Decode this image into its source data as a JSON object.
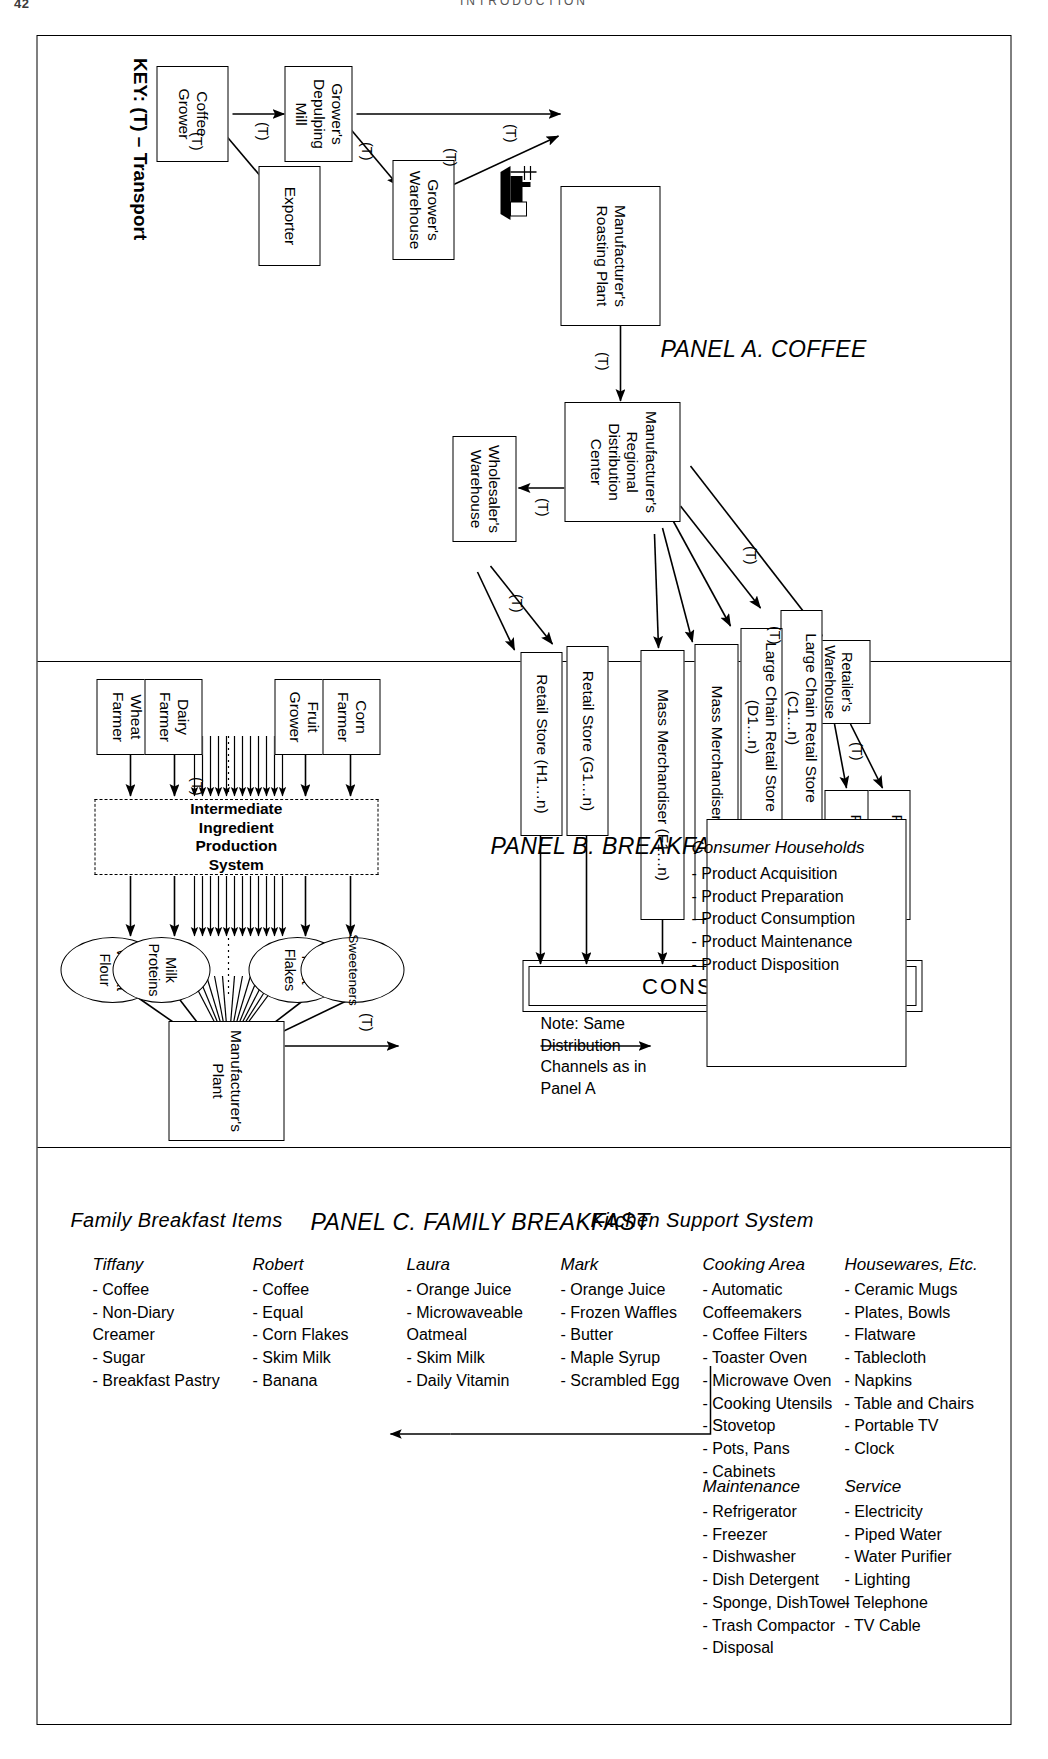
{
  "page": {
    "number": "42",
    "running_head": "INTRODUCTION"
  },
  "figure": {
    "key": "KEY: (T) – Transport",
    "transport_label": "(T)",
    "consumers_label": "CONSUMERS"
  },
  "panel_a": {
    "title": "PANEL A. COFFEE",
    "nodes": {
      "coffee_grower": "Coffee\nGrower",
      "exporter": "Exporter",
      "depulping_mill": "Grower's\nDepulping Mill",
      "growers_warehouse": "Grower's\nWarehouse",
      "roasting_plant": "Manufacturer's\nRoasting Plant",
      "regional_dc": "Manufacturer's\nRegional\nDistribution Center",
      "wholesalers_warehouse": "Wholesaler's\nWarehouse",
      "retailers_warehouse": "Retailer's\nWarehouse",
      "retail_store_a": "Retail Store (A1…n)",
      "retail_store_b": "Retail Store (B1…n)",
      "large_chain_c": "Large Chain\nRetail Store (C1…n)",
      "large_chain_d": "Large Chain\nRetail Store (D1…n)",
      "mass_merch_e": "Mass\nMerchandiser (E1…n)",
      "mass_merch_f": "Mass\nMerchandiser (F1…n)",
      "retail_store_g": "Retail Store (G1…n)",
      "retail_store_h": "Retail Store (H1…n)"
    }
  },
  "panel_b": {
    "title": "PANEL B. BREAKFAST PASTRY",
    "farmers": {
      "wheat_farmer": "Wheat\nFarmer",
      "dairy_farmer": "Dairy\nFarmer",
      "fruit_grower": "Fruit\nGrower",
      "corn_farmer": "Corn\nFarmer"
    },
    "intermediate_system": "Intermediate Ingredient Production\nSystem",
    "ingredients": {
      "wheat_flour": "Wheat\nFlour",
      "milk_proteins": "Milk\nProteins",
      "fruit_flakes": "Fruit\nFlakes",
      "sweeteners": "Sweeteners"
    },
    "manufacturers_plant": "Manufacturer's\nPlant",
    "note": "Note: Same\nDistribution\nChannels as in\nPanel A",
    "consumer_households": {
      "heading": "Consumer Households",
      "items": [
        "-  Product Acquisition",
        "-  Product Preparation",
        "-  Product Consumption",
        "-  Product Maintenance",
        "-  Product Disposition"
      ]
    }
  },
  "panel_c": {
    "title": "PANEL C. FAMILY BREAKFAST",
    "section_items": "Family Breakfast Items",
    "section_kitchen": "Kitchen Support System",
    "columns": [
      {
        "heading": "Tiffany",
        "items": [
          "-  Coffee",
          "-  Non-Diary\n   Creamer",
          "-  Sugar",
          "-  Breakfast Pastry"
        ]
      },
      {
        "heading": "Robert",
        "items": [
          "-  Coffee",
          "-  Equal",
          "-  Corn Flakes",
          "-  Skim Milk",
          "-  Banana"
        ]
      },
      {
        "heading": "Laura",
        "items": [
          "-  Orange Juice",
          "-  Microwaveable\n   Oatmeal",
          "-  Skim Milk",
          "-  Daily Vitamin"
        ]
      },
      {
        "heading": "Mark",
        "items": [
          "-  Orange Juice",
          "-  Frozen Waffles",
          "-  Butter",
          "-  Maple Syrup",
          "-  Scrambled Egg"
        ]
      },
      {
        "heading": "Cooking Area",
        "items": [
          "-  Automatic\n   Coffeemakers",
          "-  Coffee Filters",
          "-  Toaster Oven",
          "-  Microwave Oven",
          "-  Cooking Utensils",
          "-  Stovetop",
          "-  Pots, Pans",
          "-  Cabinets"
        ]
      },
      {
        "heading": "Housewares, Etc.",
        "items": [
          "-  Ceramic Mugs",
          "-  Plates, Bowls",
          "-  Flatware",
          "-  Tablecloth",
          "-  Napkins",
          "-  Table and Chairs",
          "-  Portable TV",
          "-  Clock"
        ]
      },
      {
        "heading": "Maintenance",
        "items": [
          "-  Refrigerator",
          "-  Freezer",
          "-  Dishwasher",
          "-  Dish Detergent",
          "-  Sponge, DishTowel",
          "-  Trash Compactor",
          "-  Disposal"
        ]
      },
      {
        "heading": "Service",
        "items": [
          "-  Electricity",
          "-  Piped Water",
          "-  Water Purifier",
          "-  Lighting",
          "-  Telephone",
          "-  TV Cable"
        ]
      }
    ]
  }
}
